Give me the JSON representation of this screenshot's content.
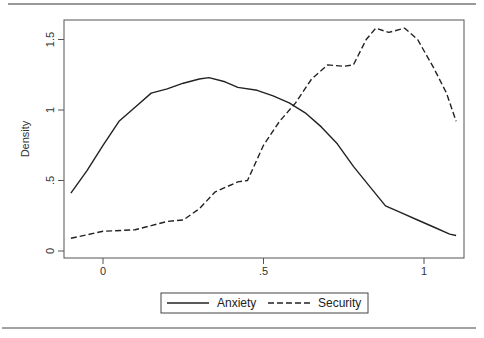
{
  "chart_data": {
    "type": "line",
    "title": "",
    "xlabel": "",
    "ylabel": "Density",
    "xlim": [
      -0.12,
      1.12
    ],
    "ylim": [
      0,
      1.63
    ],
    "x_ticks": [
      {
        "value": 0,
        "label": "0"
      },
      {
        "value": 0.5,
        "label": ".5"
      },
      {
        "value": 1,
        "label": "1"
      }
    ],
    "y_ticks": [
      {
        "value": 0,
        "label": "0"
      },
      {
        "value": 0.5,
        "label": ".5"
      },
      {
        "value": 1,
        "label": "1"
      },
      {
        "value": 1.5,
        "label": "1.5"
      }
    ],
    "grid": false,
    "legend_position": "bottom",
    "series": [
      {
        "name": "Anxiety",
        "style": "solid",
        "color": "#222222",
        "points": [
          [
            -0.1,
            0.41
          ],
          [
            -0.05,
            0.57
          ],
          [
            0,
            0.75
          ],
          [
            0.05,
            0.92
          ],
          [
            0.1,
            1.02
          ],
          [
            0.15,
            1.12
          ],
          [
            0.2,
            1.15
          ],
          [
            0.25,
            1.19
          ],
          [
            0.3,
            1.22
          ],
          [
            0.33,
            1.23
          ],
          [
            0.38,
            1.2
          ],
          [
            0.42,
            1.16
          ],
          [
            0.48,
            1.14
          ],
          [
            0.53,
            1.1
          ],
          [
            0.58,
            1.05
          ],
          [
            0.63,
            0.98
          ],
          [
            0.68,
            0.88
          ],
          [
            0.73,
            0.76
          ],
          [
            0.78,
            0.6
          ],
          [
            0.83,
            0.46
          ],
          [
            0.88,
            0.32
          ],
          [
            0.93,
            0.27
          ],
          [
            0.98,
            0.22
          ],
          [
            1.03,
            0.17
          ],
          [
            1.08,
            0.12
          ],
          [
            1.1,
            0.11
          ]
        ]
      },
      {
        "name": "Security",
        "style": "dashed",
        "color": "#222222",
        "points": [
          [
            -0.1,
            0.09
          ],
          [
            0,
            0.14
          ],
          [
            0.1,
            0.15
          ],
          [
            0.15,
            0.18
          ],
          [
            0.2,
            0.21
          ],
          [
            0.25,
            0.22
          ],
          [
            0.3,
            0.3
          ],
          [
            0.35,
            0.42
          ],
          [
            0.42,
            0.49
          ],
          [
            0.45,
            0.5
          ],
          [
            0.5,
            0.75
          ],
          [
            0.55,
            0.92
          ],
          [
            0.6,
            1.05
          ],
          [
            0.65,
            1.22
          ],
          [
            0.7,
            1.32
          ],
          [
            0.75,
            1.31
          ],
          [
            0.78,
            1.32
          ],
          [
            0.82,
            1.5
          ],
          [
            0.85,
            1.58
          ],
          [
            0.89,
            1.55
          ],
          [
            0.94,
            1.58
          ],
          [
            0.98,
            1.5
          ],
          [
            1.03,
            1.3
          ],
          [
            1.07,
            1.12
          ],
          [
            1.1,
            0.92
          ]
        ]
      }
    ]
  },
  "legend": {
    "items": [
      {
        "label": "Anxiety",
        "style": "solid"
      },
      {
        "label": "Security",
        "style": "dashed"
      }
    ]
  }
}
